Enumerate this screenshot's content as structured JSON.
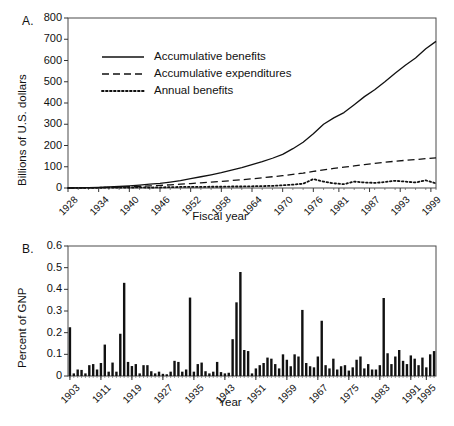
{
  "figure": {
    "panels": [
      {
        "letter": "A.",
        "ylabel": "Billions of U.S. dollars",
        "xlabel": "Fiscal year"
      },
      {
        "letter": "B.",
        "ylabel": "Percent of GNP",
        "xlabel": "Year"
      }
    ]
  },
  "chart_data": [
    {
      "type": "line",
      "panel": "A",
      "title": "",
      "xlabel": "Fiscal year",
      "ylabel": "Billions of U.S. dollars",
      "xlim": [
        1928,
        2000
      ],
      "ylim": [
        0,
        800
      ],
      "yticks": [
        0,
        100,
        200,
        300,
        400,
        500,
        600,
        700,
        800
      ],
      "xticks": [
        1928,
        1934,
        1940,
        1946,
        1952,
        1958,
        1964,
        1970,
        1976,
        1981,
        1987,
        1993,
        1999
      ],
      "grid": false,
      "legend_position": "upper-left-inside",
      "series": [
        {
          "name": "Accumulative benefits",
          "style": "solid",
          "x": [
            1928,
            1930,
            1932,
            1934,
            1936,
            1938,
            1940,
            1942,
            1944,
            1946,
            1948,
            1950,
            1952,
            1954,
            1956,
            1958,
            1960,
            1962,
            1964,
            1966,
            1968,
            1970,
            1972,
            1974,
            1976,
            1978,
            1980,
            1982,
            1984,
            1986,
            1988,
            1990,
            1992,
            1994,
            1996,
            1998,
            2000
          ],
          "values": [
            0,
            1,
            2,
            3,
            5,
            7,
            10,
            14,
            18,
            22,
            28,
            35,
            44,
            53,
            62,
            72,
            84,
            96,
            110,
            124,
            140,
            158,
            185,
            215,
            255,
            300,
            330,
            355,
            392,
            430,
            462,
            500,
            540,
            578,
            612,
            655,
            690
          ]
        },
        {
          "name": "Accumulative expenditures",
          "style": "dashed",
          "x": [
            1928,
            1930,
            1932,
            1934,
            1936,
            1938,
            1940,
            1942,
            1944,
            1946,
            1948,
            1950,
            1952,
            1954,
            1956,
            1958,
            1960,
            1962,
            1964,
            1966,
            1968,
            1970,
            1972,
            1974,
            1976,
            1978,
            1980,
            1982,
            1984,
            1986,
            1988,
            1990,
            1992,
            1994,
            1996,
            1998,
            2000
          ],
          "values": [
            0,
            1,
            1,
            2,
            3,
            4,
            6,
            8,
            10,
            12,
            15,
            18,
            21,
            24,
            28,
            31,
            35,
            39,
            43,
            48,
            53,
            58,
            64,
            70,
            78,
            85,
            92,
            98,
            104,
            110,
            116,
            121,
            126,
            130,
            134,
            138,
            142
          ]
        },
        {
          "name": "Annual benefits",
          "style": "dotted",
          "x": [
            1928,
            1930,
            1932,
            1934,
            1936,
            1938,
            1940,
            1942,
            1944,
            1946,
            1948,
            1950,
            1952,
            1954,
            1956,
            1958,
            1960,
            1962,
            1964,
            1966,
            1968,
            1970,
            1972,
            1974,
            1976,
            1978,
            1980,
            1982,
            1984,
            1986,
            1988,
            1990,
            1992,
            1994,
            1996,
            1998,
            2000
          ],
          "values": [
            0,
            1,
            1,
            1,
            2,
            2,
            2,
            3,
            2,
            3,
            4,
            5,
            5,
            5,
            6,
            6,
            7,
            7,
            8,
            9,
            10,
            13,
            16,
            20,
            42,
            30,
            22,
            18,
            30,
            26,
            24,
            28,
            34,
            30,
            26,
            36,
            22
          ]
        }
      ]
    },
    {
      "type": "bar",
      "panel": "B",
      "title": "",
      "xlabel": "Year",
      "ylabel": "Percent of GNP",
      "ylim": [
        0,
        0.6
      ],
      "yticks": [
        0,
        0.1,
        0.2,
        0.3,
        0.4,
        0.5,
        0.6
      ],
      "xticks": [
        1903,
        1911,
        1919,
        1927,
        1935,
        1943,
        1951,
        1959,
        1967,
        1975,
        1983,
        1991,
        1995
      ],
      "grid": false,
      "categories": [
        1903,
        1904,
        1905,
        1906,
        1907,
        1908,
        1909,
        1910,
        1911,
        1912,
        1913,
        1914,
        1915,
        1916,
        1917,
        1918,
        1919,
        1920,
        1921,
        1922,
        1923,
        1924,
        1925,
        1926,
        1927,
        1928,
        1929,
        1930,
        1931,
        1932,
        1933,
        1934,
        1935,
        1936,
        1937,
        1938,
        1939,
        1940,
        1941,
        1942,
        1943,
        1944,
        1945,
        1946,
        1947,
        1948,
        1949,
        1950,
        1951,
        1952,
        1953,
        1954,
        1955,
        1956,
        1957,
        1958,
        1959,
        1960,
        1961,
        1962,
        1963,
        1964,
        1965,
        1966,
        1967,
        1968,
        1969,
        1970,
        1971,
        1972,
        1973,
        1974,
        1975,
        1976,
        1977,
        1978,
        1979,
        1980,
        1981,
        1982,
        1983,
        1984,
        1985,
        1986,
        1987,
        1988,
        1989,
        1990,
        1991,
        1992,
        1993,
        1994,
        1995,
        1996,
        1997
      ],
      "values": [
        0.225,
        0.012,
        0.03,
        0.028,
        0.012,
        0.05,
        0.055,
        0.03,
        0.06,
        0.145,
        0.02,
        0.062,
        0.02,
        0.195,
        0.43,
        0.065,
        0.046,
        0.055,
        0.012,
        0.05,
        0.05,
        0.022,
        0.012,
        0.02,
        0.01,
        0.008,
        0.02,
        0.07,
        0.065,
        0.02,
        0.03,
        0.362,
        0.02,
        0.055,
        0.062,
        0.022,
        0.012,
        0.02,
        0.065,
        0.018,
        0.012,
        0.015,
        0.17,
        0.34,
        0.48,
        0.12,
        0.115,
        0.012,
        0.035,
        0.05,
        0.06,
        0.085,
        0.08,
        0.055,
        0.035,
        0.1,
        0.075,
        0.045,
        0.1,
        0.09,
        0.305,
        0.06,
        0.045,
        0.04,
        0.09,
        0.255,
        0.05,
        0.035,
        0.08,
        0.03,
        0.045,
        0.05,
        0.025,
        0.04,
        0.075,
        0.09,
        0.035,
        0.055,
        0.03,
        0.03,
        0.05,
        0.36,
        0.105,
        0.055,
        0.09,
        0.12,
        0.07,
        0.055,
        0.095,
        0.08,
        0.05,
        0.085,
        0.04,
        0.1,
        0.115
      ]
    }
  ],
  "panel_a": {
    "legend": [
      {
        "label": "Accumulative benefits",
        "style": "solid"
      },
      {
        "label": "Accumulative expenditures",
        "style": "dashed"
      },
      {
        "label": "Annual benefits",
        "style": "dotted"
      }
    ],
    "yticks": [
      "800",
      "700",
      "600",
      "500",
      "400",
      "300",
      "200",
      "100",
      "0"
    ],
    "xticks": [
      "1928",
      "1934",
      "1940",
      "1946",
      "1952",
      "1958",
      "1964",
      "1970",
      "1976",
      "1981",
      "1987",
      "1993",
      "1999"
    ]
  },
  "panel_b": {
    "yticks": [
      "0.6",
      "0.5",
      "0.4",
      "0.3",
      "0.2",
      "0.1",
      "0"
    ],
    "xticks": [
      "1903",
      "1911",
      "1919",
      "1927",
      "1935",
      "1943",
      "1951",
      "1959",
      "1967",
      "1975",
      "1983",
      "1991",
      "1995"
    ]
  }
}
